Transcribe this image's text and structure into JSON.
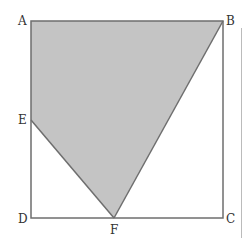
{
  "diagram": {
    "labels": {
      "A": "A",
      "B": "B",
      "C": "C",
      "D": "D",
      "E": "E",
      "F": "F"
    },
    "colors": {
      "fill": "#c4c4c4",
      "stroke": "#6e6e6e"
    },
    "shaded_region": "A-B-F-E"
  }
}
